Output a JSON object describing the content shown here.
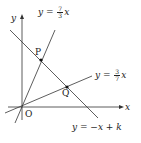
{
  "diagram": {
    "type": "coordinate-plane",
    "axes": {
      "x_label": "x",
      "y_label": "y",
      "origin_label": "O"
    },
    "lines": [
      {
        "id": "line1",
        "equation_prefix": "y = ",
        "num": "7",
        "den": "3",
        "suffix": "x"
      },
      {
        "id": "line2",
        "equation_prefix": "y = ",
        "num": "3",
        "den": "7",
        "suffix": "x"
      },
      {
        "id": "line3",
        "equation": "y = −x + k"
      }
    ],
    "points": [
      {
        "label": "P",
        "description": "intersection of y = 7/3 x and y = −x + k"
      },
      {
        "label": "Q",
        "description": "intersection of y = 3/7 x and y = −x + k"
      }
    ],
    "colors": {
      "line": "#333333",
      "text": "#222222",
      "background": "#ffffff"
    }
  }
}
